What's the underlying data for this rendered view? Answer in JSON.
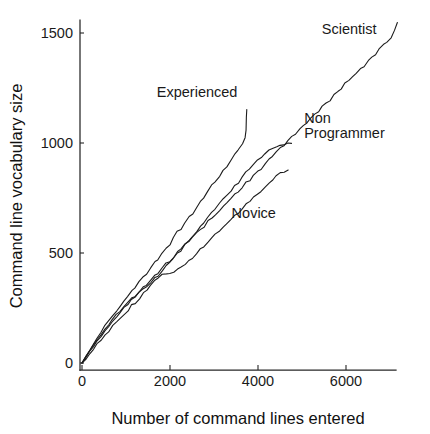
{
  "chart_data": {
    "type": "line",
    "title": "",
    "subtitle": "",
    "xlabel": "Number of command lines entered",
    "ylabel": "Command line vocabulary size",
    "xlim": [
      0,
      7400
    ],
    "ylim": [
      0,
      1600
    ],
    "xticks": [
      0,
      2000,
      4000,
      6000
    ],
    "xtick_labels": [
      "0",
      "2000",
      "4000",
      "6000"
    ],
    "yticks": [
      0,
      500,
      1000,
      1500
    ],
    "ytick_labels": [
      "0",
      "500",
      "1000",
      "1500"
    ],
    "grid": false,
    "legend": "inline-annotations",
    "line_color": "#1c1c1c",
    "series": [
      {
        "name": "Scientist",
        "label": "Scientist",
        "label_x": 5450,
        "label_y": 1495,
        "points": [
          [
            0,
            0
          ],
          [
            90,
            25
          ],
          [
            180,
            55
          ],
          [
            260,
            72
          ],
          [
            340,
            100
          ],
          [
            430,
            118
          ],
          [
            520,
            150
          ],
          [
            600,
            165
          ],
          [
            690,
            190
          ],
          [
            780,
            212
          ],
          [
            860,
            228
          ],
          [
            950,
            250
          ],
          [
            1040,
            268
          ],
          [
            1130,
            292
          ],
          [
            1210,
            300
          ],
          [
            1300,
            322
          ],
          [
            1390,
            345
          ],
          [
            1470,
            352
          ],
          [
            1560,
            375
          ],
          [
            1650,
            398
          ],
          [
            1730,
            408
          ],
          [
            1820,
            432
          ],
          [
            1910,
            452
          ],
          [
            1990,
            462
          ],
          [
            2080,
            482
          ],
          [
            2170,
            505
          ],
          [
            2250,
            515
          ],
          [
            2340,
            538
          ],
          [
            2430,
            552
          ],
          [
            2510,
            568
          ],
          [
            2600,
            590
          ],
          [
            2690,
            605
          ],
          [
            2770,
            618
          ],
          [
            2860,
            645
          ],
          [
            2950,
            662
          ],
          [
            3030,
            672
          ],
          [
            3120,
            695
          ],
          [
            3210,
            715
          ],
          [
            3290,
            725
          ],
          [
            3380,
            748
          ],
          [
            3470,
            768
          ],
          [
            3550,
            778
          ],
          [
            3640,
            800
          ],
          [
            3730,
            822
          ],
          [
            3810,
            832
          ],
          [
            3900,
            855
          ],
          [
            3990,
            872
          ],
          [
            4070,
            882
          ],
          [
            4160,
            905
          ],
          [
            4250,
            925
          ],
          [
            4330,
            935
          ],
          [
            4420,
            958
          ],
          [
            4510,
            978
          ],
          [
            4590,
            988
          ],
          [
            4680,
            1010
          ],
          [
            4770,
            1030
          ],
          [
            4850,
            1040
          ],
          [
            4940,
            1062
          ],
          [
            5030,
            1082
          ],
          [
            5110,
            1092
          ],
          [
            5200,
            1115
          ],
          [
            5290,
            1132
          ],
          [
            5370,
            1142
          ],
          [
            5460,
            1165
          ],
          [
            5550,
            1185
          ],
          [
            5630,
            1195
          ],
          [
            5720,
            1218
          ],
          [
            5810,
            1238
          ],
          [
            5890,
            1248
          ],
          [
            5980,
            1270
          ],
          [
            6070,
            1288
          ],
          [
            6150,
            1298
          ],
          [
            6240,
            1320
          ],
          [
            6330,
            1340
          ],
          [
            6410,
            1350
          ],
          [
            6500,
            1372
          ],
          [
            6590,
            1392
          ],
          [
            6670,
            1402
          ],
          [
            6760,
            1425
          ],
          [
            6850,
            1445
          ],
          [
            6930,
            1455
          ],
          [
            7020,
            1478
          ],
          [
            7110,
            1512
          ],
          [
            7160,
            1548
          ]
        ]
      },
      {
        "name": "Experienced",
        "label": "Experienced",
        "label_x": 1700,
        "label_y": 1210,
        "points": [
          [
            0,
            0
          ],
          [
            90,
            30
          ],
          [
            180,
            62
          ],
          [
            260,
            85
          ],
          [
            340,
            112
          ],
          [
            430,
            138
          ],
          [
            520,
            168
          ],
          [
            600,
            188
          ],
          [
            690,
            212
          ],
          [
            780,
            240
          ],
          [
            860,
            258
          ],
          [
            950,
            285
          ],
          [
            1040,
            305
          ],
          [
            1130,
            330
          ],
          [
            1210,
            342
          ],
          [
            1300,
            368
          ],
          [
            1390,
            392
          ],
          [
            1470,
            405
          ],
          [
            1560,
            432
          ],
          [
            1650,
            458
          ],
          [
            1730,
            472
          ],
          [
            1820,
            500
          ],
          [
            1910,
            525
          ],
          [
            1990,
            538
          ],
          [
            2080,
            568
          ],
          [
            2170,
            595
          ],
          [
            2250,
            608
          ],
          [
            2340,
            638
          ],
          [
            2430,
            665
          ],
          [
            2510,
            678
          ],
          [
            2600,
            710
          ],
          [
            2690,
            738
          ],
          [
            2770,
            752
          ],
          [
            2860,
            782
          ],
          [
            2950,
            808
          ],
          [
            3030,
            822
          ],
          [
            3120,
            852
          ],
          [
            3210,
            878
          ],
          [
            3290,
            892
          ],
          [
            3380,
            922
          ],
          [
            3470,
            950
          ],
          [
            3550,
            965
          ],
          [
            3640,
            998
          ],
          [
            3700,
            1025
          ],
          [
            3730,
            1060
          ],
          [
            3740,
            1115
          ],
          [
            3745,
            1150
          ]
        ]
      },
      {
        "name": "Non Programmer",
        "label": "Non\nProgrammer",
        "label_x": 5050,
        "label_y": 1090,
        "points": [
          [
            0,
            0
          ],
          [
            90,
            28
          ],
          [
            180,
            58
          ],
          [
            260,
            80
          ],
          [
            340,
            105
          ],
          [
            430,
            128
          ],
          [
            520,
            155
          ],
          [
            600,
            172
          ],
          [
            690,
            195
          ],
          [
            780,
            218
          ],
          [
            860,
            232
          ],
          [
            950,
            255
          ],
          [
            1040,
            272
          ],
          [
            1130,
            295
          ],
          [
            1210,
            302
          ],
          [
            1300,
            320
          ],
          [
            1390,
            340
          ],
          [
            1470,
            348
          ],
          [
            1560,
            368
          ],
          [
            1650,
            388
          ],
          [
            1730,
            398
          ],
          [
            1820,
            418
          ],
          [
            1910,
            440
          ],
          [
            1990,
            452
          ],
          [
            2080,
            475
          ],
          [
            2170,
            498
          ],
          [
            2250,
            510
          ],
          [
            2340,
            535
          ],
          [
            2430,
            558
          ],
          [
            2510,
            572
          ],
          [
            2600,
            598
          ],
          [
            2690,
            622
          ],
          [
            2770,
            635
          ],
          [
            2860,
            662
          ],
          [
            2950,
            685
          ],
          [
            3030,
            698
          ],
          [
            3120,
            725
          ],
          [
            3210,
            748
          ],
          [
            3290,
            760
          ],
          [
            3380,
            785
          ],
          [
            3470,
            808
          ],
          [
            3550,
            820
          ],
          [
            3640,
            845
          ],
          [
            3730,
            868
          ],
          [
            3810,
            880
          ],
          [
            3900,
            905
          ],
          [
            3990,
            925
          ],
          [
            4070,
            935
          ],
          [
            4160,
            952
          ],
          [
            4250,
            968
          ],
          [
            4330,
            975
          ],
          [
            4420,
            985
          ],
          [
            4510,
            992
          ],
          [
            4590,
            995
          ],
          [
            4680,
            998
          ],
          [
            4760,
            1000
          ]
        ]
      },
      {
        "name": "Novice",
        "label": "Novice",
        "label_x": 3400,
        "label_y": 660,
        "points": [
          [
            0,
            0
          ],
          [
            90,
            20
          ],
          [
            180,
            45
          ],
          [
            260,
            62
          ],
          [
            340,
            85
          ],
          [
            430,
            105
          ],
          [
            520,
            130
          ],
          [
            600,
            145
          ],
          [
            690,
            168
          ],
          [
            780,
            188
          ],
          [
            860,
            200
          ],
          [
            950,
            222
          ],
          [
            1040,
            240
          ],
          [
            1130,
            262
          ],
          [
            1210,
            272
          ],
          [
            1300,
            295
          ],
          [
            1390,
            318
          ],
          [
            1470,
            330
          ],
          [
            1560,
            355
          ],
          [
            1650,
            378
          ],
          [
            1730,
            388
          ],
          [
            1820,
            402
          ],
          [
            1910,
            408
          ],
          [
            1990,
            410
          ],
          [
            2080,
            415
          ],
          [
            2170,
            428
          ],
          [
            2250,
            438
          ],
          [
            2340,
            452
          ],
          [
            2430,
            468
          ],
          [
            2510,
            478
          ],
          [
            2600,
            498
          ],
          [
            2690,
            518
          ],
          [
            2770,
            530
          ],
          [
            2860,
            552
          ],
          [
            2950,
            572
          ],
          [
            3030,
            582
          ],
          [
            3120,
            602
          ],
          [
            3210,
            622
          ],
          [
            3290,
            632
          ],
          [
            3380,
            652
          ],
          [
            3470,
            672
          ],
          [
            3550,
            682
          ],
          [
            3640,
            702
          ],
          [
            3730,
            722
          ],
          [
            3810,
            732
          ],
          [
            3900,
            752
          ],
          [
            3990,
            772
          ],
          [
            4070,
            782
          ],
          [
            4160,
            802
          ],
          [
            4250,
            822
          ],
          [
            4330,
            832
          ],
          [
            4420,
            848
          ],
          [
            4510,
            862
          ],
          [
            4590,
            870
          ],
          [
            4680,
            878
          ]
        ]
      }
    ]
  },
  "axes": {
    "x_title": "Number of command lines entered",
    "y_title": "Command line vocabulary size"
  }
}
